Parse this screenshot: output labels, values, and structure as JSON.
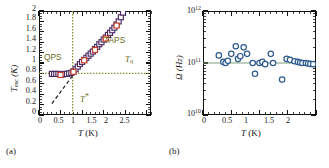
{
  "figure": {
    "panels": [
      {
        "tag": "(a)",
        "xlabel_sym": "T",
        "xlabel_unit": "(K)",
        "ylabel_sym": "T",
        "ylabel_sub": "esc",
        "ylabel_unit": "(K)",
        "xticks": [
          "0",
          "0.5",
          "1",
          "1.5",
          "2",
          "2.5"
        ],
        "yticks": [
          "0",
          "0.2",
          "0.4",
          "0.6",
          "0.8",
          "1",
          "1.2",
          "1.4",
          "1.6",
          "1.8",
          "2"
        ],
        "annotations": {
          "qps": "QPS",
          "taps": "TAPS",
          "tq_sym": "T",
          "tq_sub": "q",
          "tstar_sym": "T",
          "tstar_mark": "*"
        }
      },
      {
        "tag": "(b)",
        "xlabel_sym": "T",
        "xlabel_unit": "(K)",
        "ylabel_sym": "Ω",
        "ylabel_unit": "(Hz)",
        "xticks": [
          "0",
          "0.5",
          "1",
          "1.5",
          "2"
        ],
        "yticks": [
          "10",
          "10",
          "10"
        ],
        "yexp": [
          "10",
          "11",
          "12"
        ]
      }
    ]
  },
  "colors": {
    "marker_purple": "#4b2a63",
    "marker_red": "#c23c28",
    "marker_blue": "#2d5b8e",
    "guide_olive": "#8a8a2a",
    "fit_line": "#7f9f7f",
    "axis": "#111111"
  },
  "chart_data": [
    {
      "type": "scatter",
      "panel": "(a)",
      "title": "",
      "xlabel": "T (K)",
      "ylabel": "T_esc (K)",
      "xlim": [
        0,
        2.6
      ],
      "ylim": [
        0,
        2.0
      ],
      "grid": false,
      "legend": null,
      "annotations": [
        {
          "text": "QPS",
          "x": 0.42,
          "y": 1.05
        },
        {
          "text": "TAPS",
          "x": 1.55,
          "y": 1.42
        },
        {
          "text": "T_q",
          "x": 2.05,
          "y": 0.98
        },
        {
          "text": "T*",
          "x": 0.92,
          "y": 0.27
        }
      ],
      "guides": [
        {
          "kind": "vline",
          "label": "T*",
          "x": 0.78,
          "style": "dotted",
          "color": "#8a8a2a"
        },
        {
          "kind": "hline",
          "label": "T_q",
          "y": 0.8,
          "style": "dotted",
          "color": "#8a8a2a"
        },
        {
          "kind": "line",
          "label": "T_esc = T",
          "style": "dashed",
          "color": "#1a1a1a",
          "x": [
            0.3,
            0.82
          ],
          "y": [
            0.22,
            0.8
          ]
        }
      ],
      "series": [
        {
          "name": "T_esc",
          "marker": "open-square",
          "color": "#4b2a63",
          "x": [
            0.3,
            0.35,
            0.4,
            0.45,
            0.5,
            0.55,
            0.6,
            0.65,
            0.7,
            0.75,
            0.8,
            0.85,
            0.9,
            0.95,
            1.0,
            1.05,
            1.1,
            1.15,
            1.2,
            1.25,
            1.3,
            1.35,
            1.4,
            1.45,
            1.5,
            1.55,
            1.6,
            1.65,
            1.7,
            1.75,
            1.8,
            1.85,
            1.9,
            1.95
          ],
          "y": [
            0.79,
            0.79,
            0.79,
            0.79,
            0.78,
            0.78,
            0.79,
            0.79,
            0.8,
            0.81,
            0.84,
            0.88,
            0.93,
            0.98,
            1.02,
            1.06,
            1.1,
            1.14,
            1.18,
            1.22,
            1.27,
            1.31,
            1.36,
            1.4,
            1.45,
            1.49,
            1.54,
            1.58,
            1.63,
            1.68,
            1.74,
            1.8,
            1.88,
            1.97
          ]
        },
        {
          "name": "T_esc (second set)",
          "marker": "open-square",
          "color": "#c23c28",
          "x": [
            0.5,
            0.8,
            1.05,
            1.3,
            1.55,
            1.8
          ],
          "y": [
            0.77,
            0.83,
            1.05,
            1.25,
            1.47,
            1.72
          ]
        }
      ]
    },
    {
      "type": "scatter",
      "panel": "(b)",
      "title": "",
      "xlabel": "T (K)",
      "ylabel": "Ω (Hz)",
      "xlim": [
        0,
        2.0
      ],
      "ylim": [
        10000000000.0,
        1000000000000.0
      ],
      "yscale": "log",
      "grid": false,
      "legend": null,
      "guides": [
        {
          "kind": "hline",
          "label": "mean",
          "y": 100000000000.0,
          "style": "solid",
          "color": "#7f9f7f"
        }
      ],
      "series": [
        {
          "name": "Ω",
          "marker": "open-circle",
          "color": "#2d5b8e",
          "x": [
            0.28,
            0.36,
            0.4,
            0.44,
            0.5,
            0.58,
            0.62,
            0.66,
            0.72,
            0.78,
            0.88,
            0.92,
            1.0,
            1.05,
            1.1,
            1.2,
            1.24,
            1.4,
            1.48,
            1.54,
            1.62,
            1.68,
            1.72,
            1.76,
            1.82,
            1.86,
            1.9,
            1.95
          ],
          "y": [
            140000000000.0,
            105000000000.0,
            100000000000.0,
            110000000000.0,
            150000000000.0,
            210000000000.0,
            120000000000.0,
            135000000000.0,
            200000000000.0,
            150000000000.0,
            100000000000.0,
            62000000000.0,
            100000000000.0,
            105000000000.0,
            95000000000.0,
            150000000000.0,
            100000000000.0,
            48000000000.0,
            120000000000.0,
            115000000000.0,
            108000000000.0,
            105000000000.0,
            102000000000.0,
            100000000000.0,
            100000000000.0,
            98000000000.0,
            96000000000.0,
            95000000000.0
          ]
        }
      ]
    }
  ]
}
